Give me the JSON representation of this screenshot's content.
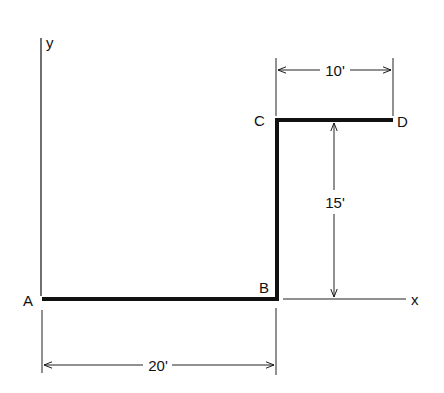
{
  "diagram": {
    "type": "structural-member-dimension-drawing",
    "axes": {
      "x_label": "x",
      "y_label": "y"
    },
    "points": [
      {
        "name": "A",
        "label": "A"
      },
      {
        "name": "B",
        "label": "B"
      },
      {
        "name": "C",
        "label": "C"
      },
      {
        "name": "D",
        "label": "D"
      }
    ],
    "segments": [
      {
        "from": "A",
        "to": "B",
        "length": "20'"
      },
      {
        "from": "B",
        "to": "C",
        "length": "15'"
      },
      {
        "from": "C",
        "to": "D",
        "length": "10'"
      }
    ],
    "dimensions": {
      "ab": "20'",
      "bc": "15'",
      "cd": "10'"
    },
    "colors": {
      "line": "#111111",
      "background": "#ffffff"
    }
  }
}
